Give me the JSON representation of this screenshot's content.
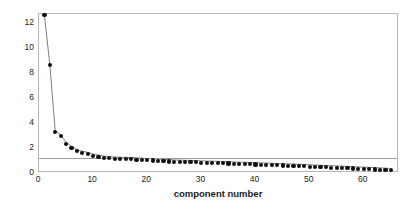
{
  "chart_data": {
    "type": "scatter",
    "title": "",
    "xlabel": "component number",
    "ylabel": "Eigen values of components",
    "xlim": [
      0,
      66.5
    ],
    "ylim": [
      0,
      12.72
    ],
    "xticks": [
      0,
      10,
      20,
      30,
      40,
      50,
      60
    ],
    "yticks": [
      0,
      2,
      4,
      6,
      8,
      10,
      12
    ],
    "grid": false,
    "legend": null,
    "marker": "filled-circle",
    "marker_color": "#101010",
    "line_color": "#6e6e72",
    "frame_color": "#b9b9bb",
    "reference_line": {
      "orientation": "horizontal",
      "value": 1.2,
      "color": "#9b9b9e"
    },
    "x": [
      1,
      2,
      3,
      4,
      5,
      6,
      7,
      8,
      9,
      10,
      11,
      12,
      13,
      14,
      15,
      16,
      17,
      18,
      19,
      20,
      21,
      22,
      23,
      24,
      25,
      26,
      27,
      28,
      29,
      30,
      31,
      32,
      33,
      34,
      35,
      36,
      37,
      38,
      39,
      40,
      41,
      42,
      43,
      44,
      45,
      46,
      47,
      48,
      49,
      50,
      51,
      52,
      53,
      54,
      55,
      56,
      57,
      58,
      59,
      60,
      61,
      62,
      63,
      64,
      65
    ],
    "values": [
      12.62,
      8.66,
      3.3,
      2.93,
      2.35,
      2.02,
      1.75,
      1.6,
      1.52,
      1.38,
      1.3,
      1.22,
      1.17,
      1.14,
      1.12,
      1.11,
      1.1,
      1.07,
      1.04,
      1.02,
      1.0,
      0.98,
      0.95,
      0.92,
      0.9,
      0.88,
      0.87,
      0.86,
      0.85,
      0.83,
      0.81,
      0.8,
      0.79,
      0.77,
      0.76,
      0.74,
      0.72,
      0.71,
      0.7,
      0.68,
      0.66,
      0.65,
      0.63,
      0.61,
      0.6,
      0.58,
      0.57,
      0.55,
      0.53,
      0.51,
      0.49,
      0.47,
      0.45,
      0.43,
      0.42,
      0.4,
      0.38,
      0.36,
      0.34,
      0.32,
      0.3,
      0.28,
      0.26,
      0.24,
      0.21
    ]
  }
}
